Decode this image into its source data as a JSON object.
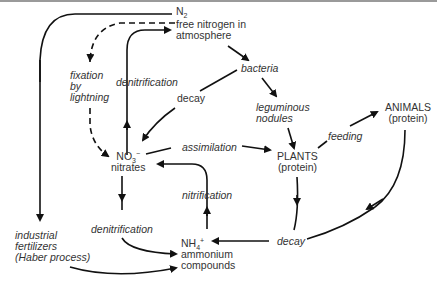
{
  "diagram": {
    "nodes": {
      "n2": {
        "formula": "N",
        "sub": "2",
        "line1": "free nitrogen in",
        "line2": "atmosphere"
      },
      "bacteria": "bacteria",
      "nodules": {
        "line1": "leguminous",
        "line2": "nodules"
      },
      "animals": {
        "line1": "ANIMALS",
        "line2": "(protein)"
      },
      "plants": {
        "line1": "PLANTS",
        "line2": "(protein)"
      },
      "nitrates": {
        "formula": "NO",
        "sub": "3",
        "sup": "−",
        "line2": "nitrates"
      },
      "ammonium": {
        "formula": "NH",
        "sub": "4",
        "sup": "+",
        "line2": "ammonium",
        "line3": "compounds"
      },
      "industrial": {
        "line1": "industrial",
        "line2": "fertilizers",
        "line3": "(Haber process)"
      }
    },
    "processes": {
      "fixation": {
        "line1": "fixation",
        "line2": "by",
        "line3": "lightning"
      },
      "denitrification_up": "denitrification",
      "decay_top": "decay",
      "assimilation": "assimilation",
      "feeding": "feeding",
      "nitrification": "nitrification",
      "denitrification_down": "denitrification",
      "decay_bottom": "decay"
    },
    "colors": {
      "line": "#111111",
      "text": "#333333",
      "background": "#ffffff"
    }
  }
}
